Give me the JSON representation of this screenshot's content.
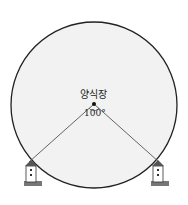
{
  "diagram": {
    "center_label": "양식장",
    "angle_label": "100°",
    "colors": {
      "fill": "#f2f2f2",
      "stroke": "#222222"
    },
    "elements": [
      "circle",
      "center-point",
      "lighthouse-left",
      "lighthouse-right"
    ]
  }
}
